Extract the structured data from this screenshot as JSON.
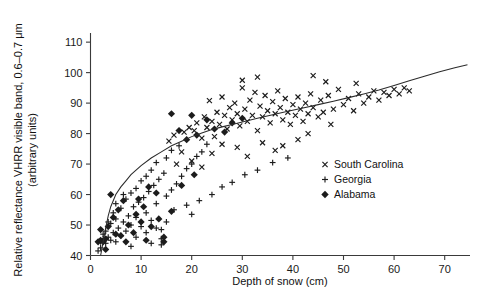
{
  "chart_data": {
    "type": "scatter",
    "title": "",
    "xlabel": "Depth of snow (cm)",
    "ylabel": "Relative reflectance VHRR visible band, 0.6–0.7 μm (arbitrary units)",
    "ylabel_line1": "Relative reflectance VHRR visible band, 0.6–0.7 μm",
    "ylabel_line2": "(arbitrary units)",
    "xlim": [
      0,
      75
    ],
    "ylim": [
      40,
      113
    ],
    "xticks": [
      0,
      10,
      20,
      30,
      40,
      50,
      60,
      70
    ],
    "yticks": [
      40,
      50,
      60,
      70,
      80,
      90,
      100,
      110
    ],
    "xticklabels": [
      "0",
      "10",
      "20",
      "30",
      "40",
      "50",
      "60",
      "70"
    ],
    "yticklabels": [
      "40",
      "50",
      "60",
      "70",
      "80",
      "90",
      "100",
      "110"
    ],
    "grid": false,
    "legend_position": "right-middle",
    "marker_color": "#1c1c1c",
    "curve_color": "#2b2b2b",
    "axis_color": "#3a3a3a",
    "legend": [
      {
        "label": "South Carolina",
        "marker": "x-marker",
        "key": "south_carolina"
      },
      {
        "label": "Georgia",
        "marker": "plus-marker",
        "key": "georgia"
      },
      {
        "label": "Alabama",
        "marker": "diamond-marker",
        "key": "alabama"
      }
    ],
    "series": [
      {
        "name": "South Carolina",
        "marker": "x",
        "points": [
          [
            16.5,
            79.5
          ],
          [
            18.5,
            80.5
          ],
          [
            19.5,
            82.0
          ],
          [
            20.5,
            81.0
          ],
          [
            21.0,
            83.5
          ],
          [
            22.0,
            78.5
          ],
          [
            22.5,
            85.5
          ],
          [
            23.0,
            82.0
          ],
          [
            23.5,
            90.8
          ],
          [
            24.0,
            84.0
          ],
          [
            24.5,
            79.0
          ],
          [
            25.0,
            87.0
          ],
          [
            25.5,
            83.0
          ],
          [
            26.0,
            92.0
          ],
          [
            26.5,
            86.0
          ],
          [
            27.0,
            81.5
          ],
          [
            27.5,
            88.5
          ],
          [
            28.0,
            84.5
          ],
          [
            28.5,
            90.0
          ],
          [
            29.0,
            86.5
          ],
          [
            29.5,
            82.5
          ],
          [
            30.0,
            95.0
          ],
          [
            30.5,
            88.0
          ],
          [
            31.0,
            84.0
          ],
          [
            31.5,
            91.0
          ],
          [
            32.0,
            86.0
          ],
          [
            32.5,
            93.5
          ],
          [
            33.0,
            81.0
          ],
          [
            33.5,
            89.0
          ],
          [
            34.0,
            85.5
          ],
          [
            34.5,
            92.5
          ],
          [
            35.0,
            87.5
          ],
          [
            35.5,
            83.5
          ],
          [
            36.0,
            90.5
          ],
          [
            36.5,
            86.5
          ],
          [
            37.0,
            94.0
          ],
          [
            37.5,
            88.5
          ],
          [
            38.0,
            84.5
          ],
          [
            38.5,
            91.5
          ],
          [
            39.0,
            87.0
          ],
          [
            39.5,
            83.0
          ],
          [
            40.0,
            89.5
          ],
          [
            40.5,
            86.0
          ],
          [
            41.0,
            92.0
          ],
          [
            41.5,
            88.0
          ],
          [
            42.0,
            84.0
          ],
          [
            42.5,
            90.0
          ],
          [
            43.0,
            86.5
          ],
          [
            43.5,
            93.0
          ],
          [
            44.0,
            88.5
          ],
          [
            45.0,
            85.5
          ],
          [
            45.5,
            91.0
          ],
          [
            46.0,
            87.0
          ],
          [
            47.0,
            92.5
          ],
          [
            48.0,
            88.0
          ],
          [
            49.0,
            94.5
          ],
          [
            50.0,
            89.5
          ],
          [
            51.0,
            91.5
          ],
          [
            52.0,
            87.5
          ],
          [
            53.0,
            93.0
          ],
          [
            54.0,
            90.0
          ],
          [
            55.0,
            92.0
          ],
          [
            56.0,
            94.0
          ],
          [
            57.0,
            91.0
          ],
          [
            58.0,
            93.5
          ],
          [
            59.0,
            92.5
          ],
          [
            60.0,
            94.5
          ],
          [
            61.0,
            93.0
          ],
          [
            62.0,
            95.0
          ],
          [
            63.0,
            94.0
          ],
          [
            30.0,
            97.5
          ],
          [
            33.0,
            98.5
          ],
          [
            44.0,
            99.0
          ],
          [
            46.5,
            97.0
          ],
          [
            52.5,
            96.5
          ],
          [
            26.0,
            76.5
          ],
          [
            29.0,
            75.5
          ],
          [
            34.0,
            77.0
          ],
          [
            38.0,
            76.0
          ],
          [
            41.0,
            78.0
          ],
          [
            24.0,
            73.5
          ],
          [
            31.0,
            72.5
          ],
          [
            36.5,
            74.5
          ],
          [
            43.0,
            80.0
          ],
          [
            47.5,
            83.0
          ],
          [
            20.0,
            71.0
          ],
          [
            22.0,
            69.0
          ],
          [
            18.0,
            74.0
          ],
          [
            17.0,
            70.0
          ],
          [
            15.5,
            77.5
          ]
        ]
      },
      {
        "name": "Georgia",
        "marker": "plus",
        "points": [
          [
            2.0,
            44.5
          ],
          [
            2.5,
            45.5
          ],
          [
            3.0,
            44.0
          ],
          [
            3.0,
            48.0
          ],
          [
            3.5,
            46.0
          ],
          [
            4.0,
            45.0
          ],
          [
            4.0,
            50.5
          ],
          [
            4.5,
            47.5
          ],
          [
            5.0,
            44.5
          ],
          [
            5.0,
            52.0
          ],
          [
            5.5,
            49.0
          ],
          [
            6.0,
            46.5
          ],
          [
            6.0,
            55.5
          ],
          [
            6.5,
            51.0
          ],
          [
            7.0,
            48.0
          ],
          [
            7.0,
            58.5
          ],
          [
            7.5,
            53.0
          ],
          [
            8.0,
            50.0
          ],
          [
            8.0,
            60.5
          ],
          [
            8.5,
            56.0
          ],
          [
            9.0,
            52.5
          ],
          [
            9.0,
            62.0
          ],
          [
            9.5,
            57.5
          ],
          [
            10.0,
            49.5
          ],
          [
            10.0,
            64.5
          ],
          [
            10.5,
            59.0
          ],
          [
            11.0,
            54.0
          ],
          [
            11.0,
            66.0
          ],
          [
            11.5,
            61.0
          ],
          [
            12.0,
            51.5
          ],
          [
            12.0,
            68.0
          ],
          [
            12.5,
            63.0
          ],
          [
            13.0,
            57.0
          ],
          [
            13.0,
            70.5
          ],
          [
            13.5,
            65.0
          ],
          [
            14.0,
            43.5
          ],
          [
            14.0,
            45.5
          ],
          [
            14.5,
            67.0
          ],
          [
            15.0,
            59.5
          ],
          [
            15.0,
            72.0
          ],
          [
            16.0,
            61.5
          ],
          [
            16.0,
            74.5
          ],
          [
            17.0,
            63.5
          ],
          [
            17.5,
            76.0
          ],
          [
            18.0,
            66.0
          ],
          [
            19.0,
            68.5
          ],
          [
            20.0,
            70.0
          ],
          [
            21.0,
            72.5
          ],
          [
            22.0,
            74.0
          ],
          [
            23.0,
            76.5
          ],
          [
            5.0,
            57.0
          ],
          [
            6.5,
            60.0
          ],
          [
            4.5,
            54.0
          ],
          [
            3.5,
            51.0
          ],
          [
            2.5,
            47.0
          ],
          [
            19.0,
            56.5
          ],
          [
            21.5,
            58.0
          ],
          [
            24.0,
            60.0
          ],
          [
            26.0,
            62.5
          ],
          [
            28.0,
            64.0
          ],
          [
            30.5,
            66.5
          ],
          [
            33.0,
            68.0
          ],
          [
            36.0,
            70.5
          ],
          [
            39.0,
            72.0
          ],
          [
            20.0,
            53.5
          ],
          [
            9.0,
            46.0
          ],
          [
            11.0,
            47.5
          ],
          [
            13.0,
            49.0
          ],
          [
            15.0,
            51.0
          ],
          [
            16.5,
            55.0
          ],
          [
            1.5,
            41.5
          ],
          [
            2.0,
            42.5
          ],
          [
            8.0,
            43.0
          ],
          [
            12.0,
            44.0
          ],
          [
            14.0,
            48.5
          ]
        ]
      },
      {
        "name": "Alabama",
        "marker": "diamond",
        "points": [
          [
            1.5,
            44.5
          ],
          [
            2.0,
            45.0
          ],
          [
            2.5,
            44.5
          ],
          [
            3.0,
            45.5
          ],
          [
            2.0,
            48.5
          ],
          [
            3.5,
            49.5
          ],
          [
            4.5,
            52.5
          ],
          [
            5.5,
            55.0
          ],
          [
            6.5,
            58.0
          ],
          [
            4.0,
            60.0
          ],
          [
            7.5,
            50.0
          ],
          [
            9.0,
            53.5
          ],
          [
            10.5,
            56.0
          ],
          [
            12.0,
            49.5
          ],
          [
            13.5,
            52.0
          ],
          [
            7.0,
            44.5
          ],
          [
            11.0,
            45.0
          ],
          [
            14.5,
            44.5
          ],
          [
            14.5,
            46.0
          ],
          [
            16.0,
            54.5
          ],
          [
            8.5,
            47.5
          ],
          [
            10.0,
            51.0
          ],
          [
            6.0,
            46.5
          ],
          [
            5.0,
            47.0
          ],
          [
            3.0,
            42.0
          ],
          [
            18.0,
            63.0
          ],
          [
            20.5,
            66.5
          ],
          [
            11.5,
            62.5
          ],
          [
            13.0,
            60.5
          ],
          [
            9.5,
            58.5
          ],
          [
            24.5,
            81.5
          ],
          [
            26.5,
            80.5
          ],
          [
            21.0,
            79.5
          ],
          [
            19.0,
            78.0
          ],
          [
            17.5,
            81.0
          ],
          [
            20.0,
            86.0
          ],
          [
            16.0,
            86.5
          ],
          [
            23.0,
            84.5
          ],
          [
            28.0,
            83.5
          ],
          [
            30.0,
            85.0
          ]
        ]
      }
    ],
    "fit_curve": {
      "description": "logarithmic fitted reflectance curve",
      "points": [
        [
          2.0,
          40.0
        ],
        [
          2.5,
          44.5
        ],
        [
          3.0,
          49.0
        ],
        [
          3.5,
          53.0
        ],
        [
          4.0,
          56.0
        ],
        [
          5.0,
          60.0
        ],
        [
          6.0,
          62.5
        ],
        [
          7.0,
          64.5
        ],
        [
          8.0,
          66.5
        ],
        [
          9.0,
          68.0
        ],
        [
          10.0,
          69.5
        ],
        [
          12.0,
          72.0
        ],
        [
          14.0,
          74.0
        ],
        [
          16.0,
          76.0
        ],
        [
          18.0,
          77.5
        ],
        [
          20.0,
          79.0
        ],
        [
          22.0,
          80.2
        ],
        [
          24.0,
          81.3
        ],
        [
          26.0,
          82.2
        ],
        [
          28.0,
          83.0
        ],
        [
          30.0,
          83.8
        ],
        [
          33.0,
          85.0
        ],
        [
          36.0,
          86.2
        ],
        [
          39.0,
          87.3
        ],
        [
          42.0,
          88.4
        ],
        [
          45.0,
          89.5
        ],
        [
          48.0,
          90.6
        ],
        [
          51.0,
          91.8
        ],
        [
          54.0,
          93.0
        ],
        [
          57.0,
          94.3
        ],
        [
          60.0,
          95.8
        ],
        [
          63.0,
          97.3
        ],
        [
          66.0,
          98.8
        ],
        [
          69.0,
          100.3
        ],
        [
          72.0,
          101.6
        ],
        [
          74.5,
          102.6
        ]
      ]
    }
  }
}
